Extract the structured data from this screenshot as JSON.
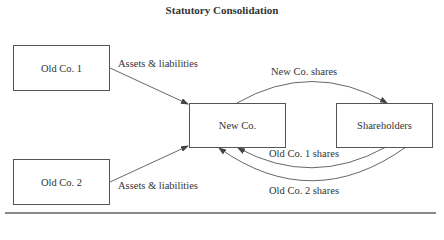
{
  "title": "Statutory Consolidation",
  "nodes": {
    "old_co_1": "Old Co. 1",
    "old_co_2": "Old Co. 2",
    "new_co": "New Co.",
    "shareholders": "Shareholders"
  },
  "edges": {
    "old1_to_new": "Assets & liabilities",
    "old2_to_new": "Assets & liabilities",
    "new_to_shareholders": "New Co. shares",
    "shareholders_to_new_1": "Old Co. 1 shares",
    "shareholders_to_new_2": "Old Co. 2 shares"
  },
  "colors": {
    "line": "#555555",
    "text": "#333333",
    "rule": "#8a8a8a"
  }
}
